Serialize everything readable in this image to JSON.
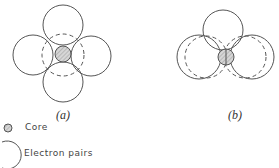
{
  "figure": {
    "panels": [
      {
        "id": "a",
        "label": "(a)",
        "description": "Four electron-pair spheres arranged tetrahedrally around central core"
      },
      {
        "id": "b",
        "label": "(b)",
        "description": "Tetrahedral arrangement viewed along another axis, showing front and back electron pairs"
      }
    ],
    "legend": {
      "items": [
        {
          "symbol": "hatched-small-circle",
          "label": "Core"
        },
        {
          "symbol": "open-large-circle",
          "label": "Electron pairs"
        }
      ]
    }
  },
  "colors": {
    "stroke": "#555555",
    "core_fill": "#cccccc",
    "background": "#ffffff"
  }
}
